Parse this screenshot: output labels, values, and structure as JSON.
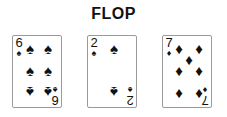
{
  "title": "FLOP",
  "cards": [
    {
      "rank": "6",
      "suit": "♠",
      "suit_name": "spades",
      "color": "#111111"
    },
    {
      "rank": "2",
      "suit": "♠",
      "suit_name": "spades",
      "color": "#111111"
    },
    {
      "rank": "7",
      "suit": "♦",
      "suit_name": "diamonds",
      "color": "#111111"
    }
  ]
}
